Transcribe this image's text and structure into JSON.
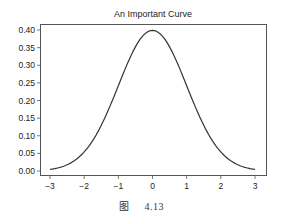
{
  "chart_data": {
    "type": "line",
    "title": "An Important Curve",
    "xlabel": "",
    "ylabel": "",
    "xlim": [
      -3.15,
      3.15
    ],
    "ylim": [
      -0.01,
      0.41
    ],
    "xticks": [
      -3,
      -2,
      -1,
      0,
      1,
      2,
      3
    ],
    "xtick_labels": [
      "−3",
      "−2",
      "−1",
      "0",
      "1",
      "2",
      "3"
    ],
    "yticks": [
      0.0,
      0.05,
      0.1,
      0.15,
      0.2,
      0.25,
      0.3,
      0.35,
      0.4
    ],
    "ytick_labels": [
      "0.00",
      "0.05",
      "0.10",
      "0.15",
      "0.20",
      "0.25",
      "0.30",
      "0.35",
      "0.40"
    ],
    "grid": false,
    "legend": null,
    "series": [
      {
        "name": "standard normal pdf",
        "color": "#333333",
        "x": [
          -3.0,
          -2.5,
          -2.0,
          -1.5,
          -1.0,
          -0.5,
          0.0,
          0.5,
          1.0,
          1.5,
          2.0,
          2.5,
          3.0
        ],
        "y": [
          0.004,
          0.018,
          0.054,
          0.13,
          0.242,
          0.352,
          0.399,
          0.352,
          0.242,
          0.13,
          0.054,
          0.018,
          0.004
        ]
      }
    ]
  },
  "caption": {
    "figure_label": "图",
    "figure_number": "4.13"
  }
}
